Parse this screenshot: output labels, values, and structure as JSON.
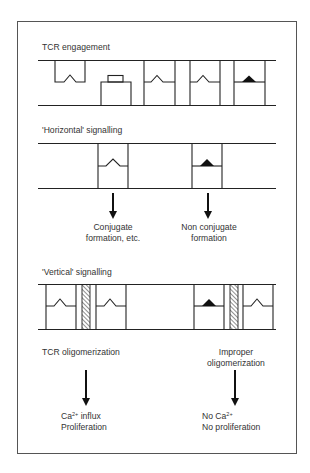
{
  "figure": {
    "sections": [
      {
        "id": "tcr-engagement",
        "title": "TCR engagement"
      },
      {
        "id": "horizontal-signalling",
        "title": "'Horizontal' signalling",
        "outcomes": [
          {
            "line1": "Conjugate",
            "line2": "formation, etc."
          },
          {
            "line1": "Non conjugate",
            "line2": "formation"
          }
        ]
      },
      {
        "id": "vertical-signalling",
        "title": "'Vertical' signalling",
        "conditions": [
          {
            "line1": "TCR oligomerization",
            "line2": ""
          },
          {
            "line1": "Improper",
            "line2": "oligomerization"
          }
        ],
        "outcomes": [
          {
            "line1_prefix": "Ca",
            "line1_sup": "2+",
            "line1_suffix": " influx",
            "line2": "Proliferation"
          },
          {
            "line1_prefix": "No Ca",
            "line1_sup": "2+",
            "line1_suffix": "",
            "line2": "No proliferation"
          }
        ]
      }
    ],
    "colors": {
      "stroke": "#222222",
      "frame": "#555555",
      "background": "#ffffff"
    }
  }
}
